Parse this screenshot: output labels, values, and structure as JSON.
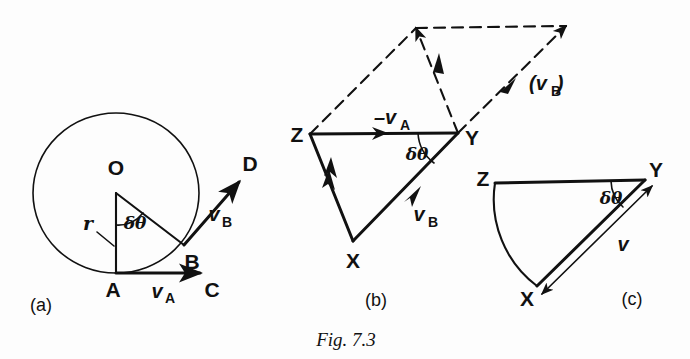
{
  "figure": {
    "caption": "Fig. 7.3",
    "background_color": "#fdfdfd",
    "ink_color": "#111111"
  },
  "panels": [
    {
      "id": "a",
      "label": "(a)",
      "description": "Particle moving on a circular path of radius r; velocity at A and at B",
      "points": [
        {
          "name": "O",
          "label": "O",
          "role": "circle-centre"
        },
        {
          "name": "A",
          "label": "A",
          "role": "position-1"
        },
        {
          "name": "B",
          "label": "B",
          "role": "position-2"
        },
        {
          "name": "C",
          "label": "C",
          "role": "tangent-end-at-A"
        },
        {
          "name": "D",
          "label": "D",
          "role": "tangent-end-at-B"
        }
      ],
      "vectors": [
        {
          "name": "v_A",
          "symbol": "v",
          "subscript": "A",
          "from": "A",
          "to": "C"
        },
        {
          "name": "v_B",
          "symbol": "v",
          "subscript": "B",
          "from": "B",
          "to": "D"
        }
      ],
      "radius_label": "r",
      "angle_label": "δθ"
    },
    {
      "id": "b",
      "label": "(b)",
      "description": "Vector triangle XYZ with dashed parallelogram construction",
      "points": [
        {
          "name": "X",
          "label": "X",
          "role": "triangle-vertex"
        },
        {
          "name": "Y",
          "label": "Y",
          "role": "triangle-vertex"
        },
        {
          "name": "Z",
          "label": "Z",
          "role": "triangle-vertex"
        }
      ],
      "vectors": [
        {
          "name": "minus-v_A",
          "symbol": "–v",
          "subscript": "A",
          "from": "Y",
          "to": "Z"
        },
        {
          "name": "v_B",
          "symbol": "v",
          "subscript": "B",
          "from": "X",
          "to": "Y"
        },
        {
          "name": "v_B-parenthesised",
          "symbol": "(v",
          "subscript": "B",
          "suffix": ")",
          "style": "dashed"
        }
      ],
      "angle_label": "δθ"
    },
    {
      "id": "c",
      "label": "(c)",
      "description": "Limiting case: chord XY becomes the velocity change v, arc ZX shown curved",
      "points": [
        {
          "name": "X",
          "label": "X",
          "role": "triangle-vertex"
        },
        {
          "name": "Y",
          "label": "Y",
          "role": "triangle-vertex"
        },
        {
          "name": "Z",
          "label": "Z",
          "role": "triangle-vertex"
        }
      ],
      "vectors": [
        {
          "name": "v",
          "symbol": "v",
          "subscript": "",
          "from": "X",
          "to": "Y",
          "double_headed": true
        }
      ],
      "angle_label": "δθ"
    }
  ]
}
